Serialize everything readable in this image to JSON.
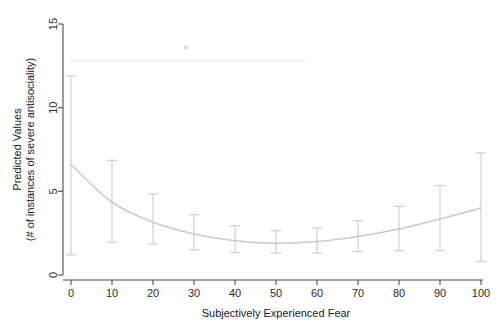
{
  "chart_data": {
    "type": "line",
    "title": "",
    "xlabel": "Subjectively Experienced Fear",
    "ylabel": "Predicted Values\n(# of instances of severe antisociality)",
    "ylabel_line1": "Predicted Values",
    "ylabel_line2": "(# of instances of severe antisociality)",
    "xlim": [
      0,
      100
    ],
    "ylim": [
      0,
      15
    ],
    "xticks": [
      0,
      10,
      20,
      30,
      40,
      50,
      60,
      70,
      80,
      90,
      100
    ],
    "xtick_labels": [
      "0",
      "10",
      "20",
      "30",
      "40",
      "50",
      "60",
      "70",
      "80",
      "90",
      "100"
    ],
    "yticks": [
      0,
      5,
      10,
      15
    ],
    "ytick_labels": [
      "0",
      "5",
      "10",
      "15"
    ],
    "grid": false,
    "legend": false,
    "x": [
      0,
      10,
      20,
      30,
      40,
      50,
      60,
      70,
      80,
      90,
      100
    ],
    "values": [
      6.6,
      4.35,
      3.15,
      2.45,
      2.05,
      1.9,
      2.0,
      2.3,
      2.75,
      3.35,
      4.0
    ],
    "series": [
      {
        "name": "Predicted values",
        "values": [
          6.6,
          4.35,
          3.15,
          2.45,
          2.05,
          1.9,
          2.0,
          2.3,
          2.75,
          3.35,
          4.0
        ]
      }
    ],
    "error_bars": {
      "style": "capped-vertical",
      "lower": [
        1.2,
        1.95,
        1.85,
        1.5,
        1.35,
        1.3,
        1.3,
        1.4,
        1.45,
        1.45,
        0.8
      ],
      "upper": [
        11.9,
        6.85,
        4.85,
        3.6,
        2.95,
        2.65,
        2.8,
        3.25,
        4.1,
        5.35,
        7.3
      ]
    },
    "annotations": [
      {
        "name": "faint-horizontal-artifact",
        "y": 12.8,
        "x_start": 0,
        "x_end": 57
      },
      {
        "name": "faint-dot-artifact",
        "x": 28,
        "y": 13.6
      }
    ],
    "colors": {
      "curve": "#c9c9c9",
      "error_bar": "#cfcfcf",
      "axis": "#4a4a4a",
      "text": "#1a1a1a",
      "background": "#ffffff",
      "artifact": "#e2e2e2"
    }
  }
}
